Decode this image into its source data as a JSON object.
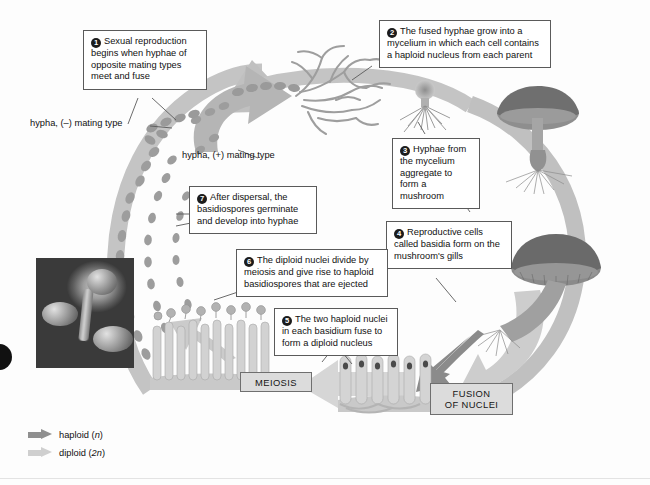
{
  "diagram": {
    "callouts": [
      {
        "number": "1",
        "text": "Sexual reproduction begins when hyphae of opposite mating types meet and fuse"
      },
      {
        "number": "2",
        "text": "The fused hyphae grow into a mycelium in which each cell contains a haploid nucleus from each parent"
      },
      {
        "number": "3",
        "text": "Hyphae from the mycelium aggregate to form a mushroom"
      },
      {
        "number": "4",
        "text": "Reproductive cells called basidia form on the mushroom's gills"
      },
      {
        "number": "5",
        "text": "The two haploid nuclei in each basidium fuse to form a diploid nucleus"
      },
      {
        "number": "6",
        "text": "The diploid nuclei divide by meiosis and give rise to haploid basidiospores that are ejected"
      },
      {
        "number": "7",
        "text": "After dispersal, the basidiospores germinate and develop into hyphae"
      }
    ],
    "labels": {
      "hypha_minus": "hypha, (–) mating type",
      "hypha_plus": "hypha, (+) mating type"
    },
    "stages": {
      "meiosis": "MEIOSIS",
      "fusion_line1": "FUSION",
      "fusion_line2": "OF NUCLEI"
    },
    "legend": [
      {
        "label": "haploid (",
        "italic": "n",
        "suffix": ")",
        "color": "#8f8f8f",
        "name": "haploid-arrow"
      },
      {
        "label": "diploid (",
        "italic": "2n",
        "suffix": ")",
        "color": "#cfcfcf",
        "name": "diploid-arrow"
      }
    ],
    "colors": {
      "haploid_arrow": "#8f8f8f",
      "diploid_arrow": "#cfcfcf",
      "cycle_arrow": "#b9b9b9",
      "callout_border": "#5a5a5a",
      "stage_box_fill": "#dcdcdc",
      "text": "#111111"
    },
    "figures": {
      "micrograph": "sem-micrograph-basidium",
      "mycelium": "branching-mycelium",
      "mushroom_button": "emerging-mushroom-button",
      "mushroom_upper": "mature-mushroom-upper",
      "mushroom_lower": "mature-mushroom-lower",
      "gills_left": "gill-basidia-with-spores",
      "gills_right": "gill-basidia-fusing-nuclei",
      "spore_chain_minus": "spore-chain-minus-mating-type",
      "spore_chain_plus": "spore-chain-plus-mating-type"
    }
  }
}
